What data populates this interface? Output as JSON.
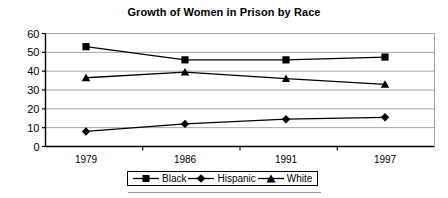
{
  "chart_data": {
    "type": "line",
    "title": "Growth of Women in Prison by Race",
    "xlabel": "",
    "ylabel": "",
    "categories": [
      "1979",
      "1986",
      "1991",
      "1997"
    ],
    "series": [
      {
        "name": "Black",
        "marker": "square",
        "values": [
          53,
          46,
          46,
          47.5
        ]
      },
      {
        "name": "Hispanic",
        "marker": "diamond",
        "values": [
          8,
          12,
          14.5,
          15.5
        ]
      },
      {
        "name": "White",
        "marker": "triangle",
        "values": [
          36.5,
          39.5,
          36,
          33
        ]
      }
    ],
    "ylim": [
      0,
      60
    ],
    "yticks": [
      "0",
      "10",
      "20",
      "30",
      "40",
      "50",
      "60"
    ],
    "ytick_values": [
      0,
      10,
      20,
      30,
      40,
      50,
      60
    ],
    "grid": true,
    "legend_position": "bottom",
    "colors": {
      "line": "#000000",
      "marker": "#000000",
      "gridline": "#a6a6a6",
      "axis": "#000000",
      "background": "#ffffff"
    }
  },
  "legend": {
    "entries": [
      {
        "label": "Black"
      },
      {
        "label": "Hispanic"
      },
      {
        "label": "White"
      }
    ]
  }
}
